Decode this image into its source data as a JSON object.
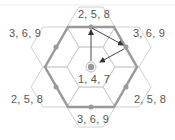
{
  "diagram": {
    "type": "hexagonal-grid",
    "colors": {
      "grid_line": "#d0d0d0",
      "outer_hex": "#9a9a9a",
      "edge_dot": "#9a9a9a",
      "arrow": "#333333",
      "center_dot": "#9a9a9a",
      "center_ring": "#bdbdbd",
      "text": "#555555"
    },
    "labels": {
      "center": "1, 4, 7",
      "top": "2, 5, 8",
      "upper_left": "3, 6, 9",
      "upper_right": "3, 6, 9",
      "lower_left": "2, 5, 8",
      "lower_right": "2, 5, 8",
      "bottom": "3, 6, 9"
    },
    "arrows": [
      {
        "from": "center",
        "to": "top-edge-midpoint"
      },
      {
        "from": "top-edge-midpoint",
        "to": "upper-right-edge-midpoint"
      },
      {
        "from": "upper-right-edge-midpoint",
        "to": "center"
      }
    ]
  }
}
